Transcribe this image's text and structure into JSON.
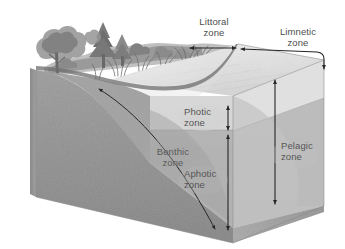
{
  "diagram": {
    "type": "illustration",
    "labels": {
      "littoral": "Littoral\nzone",
      "littoral_line1": "Littoral",
      "littoral_line2": "zone",
      "limnetic_line1": "Limnetic",
      "limnetic_line2": "zone",
      "photic_line1": "Photic",
      "photic_line2": "zone",
      "aphotic_line1": "Aphotic",
      "aphotic_line2": "zone",
      "benthic_line1": "Benthic",
      "benthic_line2": "zone",
      "pelagic_line1": "Pelagic",
      "pelagic_line2": "zone"
    },
    "colors": {
      "background": "#ffffff",
      "text": "#4d4d4d",
      "arrow": "#2b2b2b",
      "sediment_front": "#9a9a9a",
      "sediment_left": "#8e8e8e",
      "sediment_right": "#a8a8a8",
      "water_surface": "#dcdcdc",
      "photic_water": "#c9c9c9",
      "aphotic_water": "#adadad",
      "vegetation": "#707070",
      "shore_soil": "#6f6f6f"
    }
  }
}
